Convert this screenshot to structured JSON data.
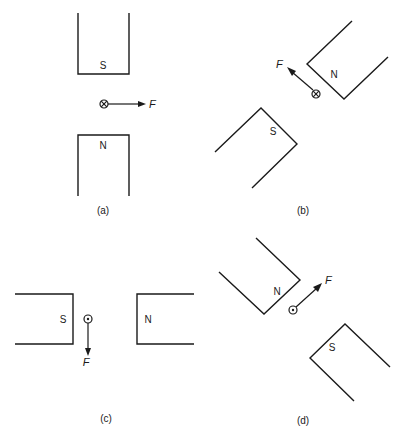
{
  "figure": {
    "panels": [
      {
        "id": "a",
        "caption": "(a)",
        "magnet_1_pole": "S",
        "magnet_2_pole": "N",
        "current_direction": "into page",
        "current_symbol": "⊗",
        "force_label": "F",
        "force_direction": "right"
      },
      {
        "id": "b",
        "caption": "(b)",
        "magnet_1_pole": "N",
        "magnet_2_pole": "S",
        "current_direction": "into page",
        "current_symbol": "⊗",
        "force_label": "F",
        "force_direction": "up-left"
      },
      {
        "id": "c",
        "caption": "(c)",
        "magnet_1_pole": "S",
        "magnet_2_pole": "N",
        "current_direction": "out of page",
        "current_symbol": "⊙",
        "force_label": "F",
        "force_direction": "down"
      },
      {
        "id": "d",
        "caption": "(d)",
        "magnet_1_pole": "N",
        "magnet_2_pole": "S",
        "current_direction": "out of page",
        "current_symbol": "⊙",
        "force_label": "F",
        "force_direction": "up-right"
      }
    ]
  }
}
